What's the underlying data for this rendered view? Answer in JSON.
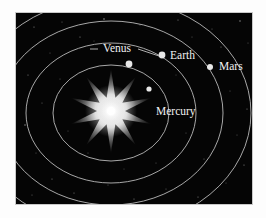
{
  "figure": {
    "background_color": "#ffffff",
    "panel_color": "#050505",
    "border_color": "#c9c9c9",
    "orbit_color": "#b9b9b9",
    "label_color": "#f2f2f2",
    "sun_color": "#ffffff"
  },
  "sun": {
    "name": "sun",
    "cx": 95,
    "cy": 98,
    "points": 10,
    "outer_radius": 42,
    "inner_radius": 14,
    "glow_radius": 26
  },
  "orbits": [
    {
      "name": "mercury-orbit",
      "cx": 95,
      "cy": 100,
      "rx": 58,
      "ry": 48
    },
    {
      "name": "venus-orbit",
      "cx": 95,
      "cy": 100,
      "rx": 85,
      "ry": 70
    },
    {
      "name": "earth-orbit",
      "cx": 95,
      "cy": 100,
      "rx": 112,
      "ry": 92
    },
    {
      "name": "mars-orbit",
      "cx": 95,
      "cy": 100,
      "rx": 140,
      "ry": 115
    }
  ],
  "planets": [
    {
      "name": "mercury",
      "label": "Mercury",
      "body_x": 133,
      "body_y": 76,
      "body_r": 2.6,
      "label_x": 140,
      "label_y": 102,
      "label_anchor": "start",
      "leader": null
    },
    {
      "name": "venus",
      "label": "Venus",
      "body_x": 113,
      "body_y": 51,
      "body_r": 3.4,
      "label_x": 101,
      "label_y": 39,
      "label_anchor": "middle",
      "leader": "M 74 36 L 82 36 M 122 36 L 146 44"
    },
    {
      "name": "earth",
      "label": "Earth",
      "body_x": 146,
      "body_y": 42,
      "body_r": 3.4,
      "label_x": 154,
      "label_y": 46,
      "label_anchor": "start",
      "leader": null
    },
    {
      "name": "mars",
      "label": "Mars",
      "body_x": 194,
      "body_y": 54,
      "body_r": 3.0,
      "label_x": 203,
      "label_y": 57,
      "label_anchor": "start",
      "leader": null
    }
  ],
  "starfield": [
    {
      "x": 18,
      "y": 14,
      "r": 0.6,
      "o": 0.55
    },
    {
      "x": 46,
      "y": 9,
      "r": 0.5,
      "o": 0.45
    },
    {
      "x": 88,
      "y": 6,
      "r": 0.7,
      "o": 0.7
    },
    {
      "x": 124,
      "y": 12,
      "r": 0.5,
      "o": 0.4
    },
    {
      "x": 162,
      "y": 7,
      "r": 0.6,
      "o": 0.5
    },
    {
      "x": 196,
      "y": 16,
      "r": 0.5,
      "o": 0.45
    },
    {
      "x": 224,
      "y": 8,
      "r": 0.7,
      "o": 0.6
    },
    {
      "x": 232,
      "y": 30,
      "r": 0.5,
      "o": 0.4
    },
    {
      "x": 205,
      "y": 34,
      "r": 0.55,
      "o": 0.5
    },
    {
      "x": 176,
      "y": 24,
      "r": 0.5,
      "o": 0.4
    },
    {
      "x": 64,
      "y": 24,
      "r": 0.6,
      "o": 0.55
    },
    {
      "x": 34,
      "y": 40,
      "r": 0.5,
      "o": 0.4
    },
    {
      "x": 12,
      "y": 62,
      "r": 0.6,
      "o": 0.5
    },
    {
      "x": 26,
      "y": 90,
      "r": 0.5,
      "o": 0.45
    },
    {
      "x": 9,
      "y": 112,
      "r": 0.7,
      "o": 0.6
    },
    {
      "x": 20,
      "y": 140,
      "r": 0.5,
      "o": 0.4
    },
    {
      "x": 36,
      "y": 166,
      "r": 0.6,
      "o": 0.5
    },
    {
      "x": 16,
      "y": 182,
      "r": 0.5,
      "o": 0.45
    },
    {
      "x": 58,
      "y": 180,
      "r": 0.55,
      "o": 0.5
    },
    {
      "x": 92,
      "y": 172,
      "r": 0.5,
      "o": 0.4
    },
    {
      "x": 118,
      "y": 186,
      "r": 0.6,
      "o": 0.5
    },
    {
      "x": 150,
      "y": 176,
      "r": 0.5,
      "o": 0.45
    },
    {
      "x": 182,
      "y": 184,
      "r": 0.6,
      "o": 0.5
    },
    {
      "x": 210,
      "y": 170,
      "r": 0.5,
      "o": 0.4
    },
    {
      "x": 228,
      "y": 152,
      "r": 0.6,
      "o": 0.55
    },
    {
      "x": 221,
      "y": 122,
      "r": 0.5,
      "o": 0.4
    },
    {
      "x": 231,
      "y": 96,
      "r": 0.6,
      "o": 0.5
    },
    {
      "x": 214,
      "y": 78,
      "r": 0.5,
      "o": 0.4
    },
    {
      "x": 170,
      "y": 120,
      "r": 0.5,
      "o": 0.4
    },
    {
      "x": 188,
      "y": 146,
      "r": 0.55,
      "o": 0.45
    },
    {
      "x": 140,
      "y": 150,
      "r": 0.5,
      "o": 0.4
    },
    {
      "x": 108,
      "y": 156,
      "r": 0.5,
      "o": 0.35
    },
    {
      "x": 72,
      "y": 140,
      "r": 0.5,
      "o": 0.4
    },
    {
      "x": 52,
      "y": 118,
      "r": 0.5,
      "o": 0.35
    },
    {
      "x": 44,
      "y": 66,
      "r": 0.5,
      "o": 0.4
    },
    {
      "x": 78,
      "y": 28,
      "r": 0.5,
      "o": 0.35
    },
    {
      "x": 152,
      "y": 98,
      "r": 0.5,
      "o": 0.35
    },
    {
      "x": 160,
      "y": 62,
      "r": 0.5,
      "o": 0.35
    }
  ]
}
